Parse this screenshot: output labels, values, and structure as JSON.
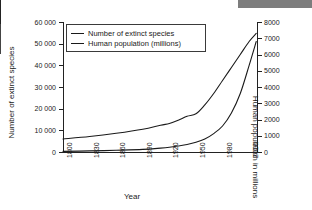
{
  "decor": {
    "top_bar_color": "#7d7d7d"
  },
  "chart_data": {
    "type": "line",
    "title": "",
    "xlabel": "Year",
    "ylabel": "Number of extinct species",
    "y2label": "Human population in millions",
    "grid": false,
    "legend_position": "top-left",
    "xlim": [
      1800,
      2020
    ],
    "ylim": [
      0,
      60000
    ],
    "y2lim": [
      0,
      8000
    ],
    "xticks": [
      1800,
      1830,
      1860,
      1890,
      1920,
      1950,
      1980,
      2010
    ],
    "xtick_labels": [
      "1800",
      "1830",
      "1860",
      "1890",
      "1920",
      "1950",
      "1980",
      "2010"
    ],
    "yticks": [
      0,
      10000,
      20000,
      30000,
      40000,
      50000,
      60000
    ],
    "ytick_labels": [
      "0",
      "10 000",
      "20 000",
      "30 000",
      "40 000",
      "50 000",
      "60 000"
    ],
    "y2ticks": [
      0,
      1000,
      2000,
      3000,
      4000,
      5000,
      6000,
      7000,
      8000
    ],
    "y2tick_labels": [
      "0",
      "1000",
      "2000",
      "3000",
      "4000",
      "5000",
      "6000",
      "7000",
      "8000"
    ],
    "series": [
      {
        "name": "Number of extinct species",
        "axis": "left",
        "x": [
          1800,
          1830,
          1860,
          1890,
          1910,
          1920,
          1930,
          1940,
          1950,
          1960,
          1970,
          1980,
          1990,
          2000,
          2010,
          2018
        ],
        "values": [
          300,
          500,
          800,
          1200,
          1800,
          2200,
          2800,
          3500,
          4500,
          6000,
          8500,
          12000,
          18000,
          27000,
          40000,
          51000
        ]
      },
      {
        "name": "Human population (millions)",
        "axis": "right",
        "x": [
          1800,
          1830,
          1860,
          1890,
          1910,
          1920,
          1930,
          1940,
          1950,
          1960,
          1970,
          1980,
          1990,
          2000,
          2010,
          2018
        ],
        "values": [
          800,
          950,
          1150,
          1400,
          1650,
          1750,
          1950,
          2200,
          2350,
          2900,
          3600,
          4400,
          5200,
          6000,
          6800,
          7300
        ]
      }
    ]
  },
  "legend": {
    "entries": [
      {
        "label": "Number of extinct species"
      },
      {
        "label": "Human population (millions)"
      }
    ]
  }
}
